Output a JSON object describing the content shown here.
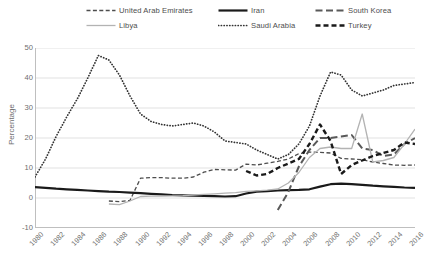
{
  "chart_data": {
    "type": "line",
    "title": "",
    "xlabel": "",
    "ylabel": "Percentage",
    "ylim": [
      -10,
      50
    ],
    "yticks": [
      50,
      40,
      30,
      20,
      10,
      0,
      -10
    ],
    "xlim": [
      1980,
      2016
    ],
    "grid": "horizontal",
    "legend_position": "top",
    "categories": [
      1980,
      1981,
      1982,
      1983,
      1984,
      1985,
      1986,
      1987,
      1988,
      1989,
      1990,
      1991,
      1992,
      1993,
      1994,
      1995,
      1996,
      1997,
      1998,
      1999,
      2000,
      2001,
      2002,
      2003,
      2004,
      2005,
      2006,
      2007,
      2008,
      2009,
      2010,
      2011,
      2012,
      2013,
      2014,
      2015,
      2016
    ],
    "series": [
      {
        "name": "United Arab Emirates",
        "style": "dashed-thin",
        "color": "#4d4d4d",
        "values": [
          null,
          null,
          null,
          null,
          null,
          null,
          null,
          -1.0,
          -1.2,
          -0.8,
          6.6,
          6.8,
          6.8,
          6.6,
          6.6,
          7.0,
          8.6,
          9.5,
          9.4,
          9.3,
          11.3,
          11.0,
          11.6,
          12.2,
          13.0,
          14.8,
          15.3,
          15.2,
          15.0,
          13.2,
          13.0,
          12.8,
          12.0,
          11.5,
          11.0,
          10.9,
          11.0
        ]
      },
      {
        "name": "Iran",
        "style": "solid-thick",
        "color": "#1a1a1a",
        "values": [
          3.6,
          3.4,
          3.1,
          2.9,
          2.7,
          2.5,
          2.3,
          2.1,
          2.0,
          1.8,
          1.6,
          1.4,
          1.2,
          1.0,
          0.9,
          0.8,
          0.7,
          0.6,
          0.5,
          0.6,
          1.5,
          2.1,
          2.3,
          2.5,
          2.6,
          2.7,
          2.9,
          3.8,
          4.6,
          4.8,
          4.6,
          4.4,
          4.1,
          3.9,
          3.7,
          3.5,
          3.4
        ]
      },
      {
        "name": "South Korea",
        "style": "dashed-long",
        "color": "#595959",
        "values": [
          null,
          null,
          null,
          null,
          null,
          null,
          null,
          null,
          null,
          null,
          null,
          null,
          null,
          null,
          null,
          null,
          null,
          null,
          null,
          null,
          null,
          null,
          null,
          -4.0,
          2.0,
          10.5,
          16.0,
          20.0,
          20.0,
          20.5,
          21.0,
          16.5,
          16.0,
          14.0,
          14.5,
          18.0,
          20.0
        ]
      },
      {
        "name": "Libya",
        "style": "solid-thin-light",
        "color": "#b3b3b3",
        "values": [
          null,
          null,
          null,
          null,
          null,
          null,
          null,
          -2.0,
          -2.2,
          -1.0,
          0.5,
          0.6,
          0.6,
          0.7,
          0.8,
          1.0,
          1.2,
          1.4,
          1.6,
          1.8,
          2.2,
          2.4,
          2.6,
          3.0,
          5.0,
          8.5,
          13.5,
          16.5,
          17.0,
          16.5,
          16.5,
          28.0,
          12.0,
          12.5,
          13.5,
          18.0,
          23.0
        ]
      },
      {
        "name": "Saudi Arabia",
        "style": "dotted",
        "color": "#333333",
        "values": [
          7.0,
          13.0,
          20.5,
          27.0,
          33.0,
          40.0,
          47.5,
          46.0,
          41.0,
          34.0,
          28.0,
          25.5,
          24.5,
          24.0,
          24.5,
          25.0,
          24.0,
          22.0,
          19.0,
          18.5,
          18.0,
          16.0,
          14.5,
          13.0,
          14.5,
          18.0,
          24.0,
          34.0,
          42.0,
          41.0,
          36.0,
          34.0,
          35.0,
          36.0,
          37.5,
          38.0,
          38.5
        ]
      },
      {
        "name": "Turkey",
        "style": "dashed-heavy",
        "color": "#1a1a1a",
        "values": [
          null,
          null,
          null,
          null,
          null,
          null,
          null,
          null,
          null,
          null,
          null,
          null,
          null,
          null,
          null,
          null,
          null,
          null,
          null,
          null,
          9.0,
          7.5,
          8.0,
          10.0,
          11.5,
          13.0,
          18.0,
          24.5,
          19.0,
          8.0,
          11.0,
          12.5,
          14.0,
          15.0,
          16.0,
          18.5,
          18.0
        ]
      }
    ]
  },
  "legend": {
    "items": [
      {
        "label": "United Arab Emirates",
        "style": "dashed-thin",
        "color": "#4d4d4d"
      },
      {
        "label": "Iran",
        "style": "solid-thick",
        "color": "#1a1a1a"
      },
      {
        "label": "South Korea",
        "style": "dashed-long",
        "color": "#595959"
      },
      {
        "label": "Libya",
        "style": "solid-thin-light",
        "color": "#b3b3b3"
      },
      {
        "label": "Saudi Arabia",
        "style": "dotted",
        "color": "#333333"
      },
      {
        "label": "Turkey",
        "style": "dashed-heavy",
        "color": "#1a1a1a"
      }
    ]
  },
  "axes": {
    "y_title": "Percentage",
    "y_ticks": [
      "50",
      "40",
      "30",
      "20",
      "10",
      "0",
      "-10"
    ],
    "x_ticks": [
      "1980",
      "1982",
      "1984",
      "1986",
      "1988",
      "1990",
      "1992",
      "1994",
      "1996",
      "1998",
      "2000",
      "2002",
      "2004",
      "2006",
      "2008",
      "2010",
      "2012",
      "2014",
      "2016"
    ]
  },
  "colors": {
    "grid": "#d9d9d9",
    "axis": "#bfbfbf",
    "text": "#6e6e6e",
    "background": "#ffffff"
  }
}
